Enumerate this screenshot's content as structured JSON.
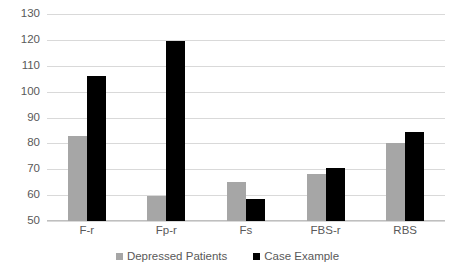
{
  "chart_data": {
    "type": "bar",
    "title": "",
    "subtitle": "",
    "xlabel": "",
    "ylabel": "",
    "categories": [
      "F-r",
      "Fp-r",
      "Fs",
      "FBS-r",
      "RBS"
    ],
    "series": [
      {
        "name": "Depressed Patients",
        "color": "#a6a6a6",
        "values": [
          83,
          59.5,
          65,
          68,
          80
        ]
      },
      {
        "name": "Case Example",
        "color": "#000000",
        "values": [
          106,
          119.5,
          58.5,
          70.5,
          84.5
        ]
      }
    ],
    "ylim": [
      50,
      130
    ],
    "ytick_step": 10,
    "yticks": [
      130,
      120,
      110,
      100,
      90,
      80,
      70,
      60,
      50
    ],
    "ytick_labels": [
      "130",
      "120",
      "110",
      "100",
      "90",
      "80",
      "70",
      "60",
      "50"
    ],
    "grid": {
      "horizontal": true,
      "vertical": false,
      "color": "#d9d9d9"
    },
    "legend": {
      "position": "bottom",
      "entries": [
        {
          "label": "Depressed Patients",
          "color": "#a6a6a6"
        },
        {
          "label": "Case Example",
          "color": "#000000"
        }
      ]
    },
    "background_color": "#ffffff",
    "axis_color": "#bfbfbf",
    "text_color": "#595959"
  }
}
